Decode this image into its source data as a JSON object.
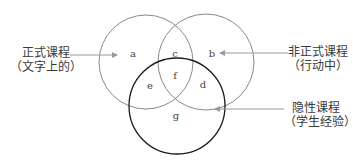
{
  "diagram": {
    "type": "venn",
    "circles": [
      {
        "id": "formal",
        "label": "正式课程",
        "sublabel": "（文字上的）",
        "cx": 146,
        "cy": 62,
        "r": 47,
        "stroke": "#8a8a8a"
      },
      {
        "id": "informal",
        "label": "非正式课程",
        "sublabel": "（行动中）",
        "cx": 206,
        "cy": 62,
        "r": 48,
        "stroke": "#8a8a8a"
      },
      {
        "id": "hidden",
        "label": "隐性课程",
        "sublabel": "（学生经验）",
        "cx": 177,
        "cy": 106,
        "r": 48,
        "stroke": "#1a1a1a"
      }
    ],
    "regions": {
      "a": "a",
      "b": "b",
      "c": "c",
      "d": "d",
      "e": "e",
      "f": "f",
      "g": "g"
    },
    "arrow_color": "#9a9a9a"
  }
}
